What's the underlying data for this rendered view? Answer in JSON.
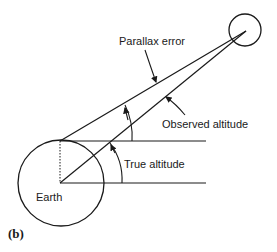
{
  "figure": {
    "panel_label": "(b)",
    "labels": {
      "parallax_error": "Parallax error",
      "observed_altitude": "Observed altitude",
      "true_altitude": "True altitude",
      "earth": "Earth"
    },
    "colors": {
      "stroke": "#1a1a1a",
      "background": "#ffffff"
    }
  }
}
